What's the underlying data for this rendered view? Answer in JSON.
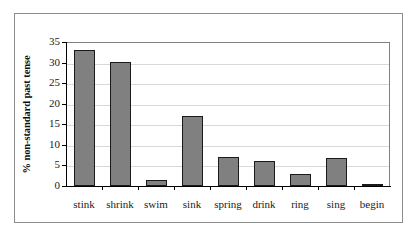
{
  "chart_data": {
    "type": "bar",
    "title": "",
    "subtitle": "",
    "xlabel": "",
    "ylabel": "% non-standard past tense",
    "categories": [
      "stink",
      "shrink",
      "swim",
      "sink",
      "spring",
      "drink",
      "ring",
      "sing",
      "begin"
    ],
    "values": [
      33.0,
      30.2,
      1.5,
      17.0,
      7.0,
      6.0,
      3.0,
      6.7,
      0.4
    ],
    "ylim": [
      0,
      35
    ],
    "ytick_labels": [
      "0",
      "5",
      "10",
      "15",
      "20",
      "25",
      "30",
      "35"
    ],
    "ytick_values": [
      0,
      5,
      10,
      15,
      20,
      25,
      30,
      35
    ],
    "grid": "horizontal",
    "legend": "none",
    "bar_color": "#808080",
    "bar_edge_color": "#1a1a1a",
    "gridline_color": "#d9d9d9",
    "axis_color": "#000000",
    "frame_color": "#8c8c8c",
    "background": "#ffffff"
  }
}
